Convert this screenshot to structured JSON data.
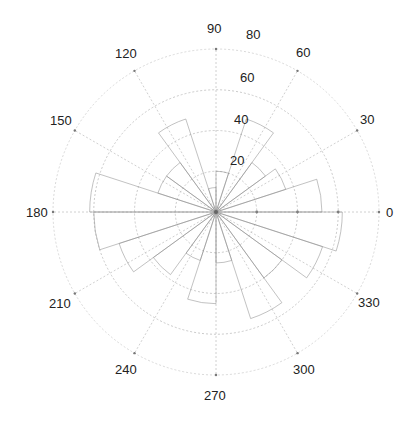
{
  "chart_data": {
    "type": "polar-rose",
    "title": "",
    "angular_ticks_deg": [
      0,
      30,
      60,
      90,
      120,
      150,
      180,
      210,
      240,
      270,
      300,
      330
    ],
    "angular_tick_labels": [
      "0",
      "30",
      "60",
      "90",
      "120",
      "150",
      "180",
      "210",
      "240",
      "270",
      "300",
      "330"
    ],
    "radial_ticks": [
      20,
      40,
      60,
      80
    ],
    "radial_tick_labels": [
      "20",
      "40",
      "60",
      "80"
    ],
    "rlim": [
      0,
      80
    ],
    "radial_label_angle_deg": 80,
    "grid": true,
    "bin_width_deg": 18,
    "bins": [
      {
        "start": 0,
        "end": 18,
        "value": 52
      },
      {
        "start": 18,
        "end": 36,
        "value": 36
      },
      {
        "start": 36,
        "end": 54,
        "value": 30
      },
      {
        "start": 54,
        "end": 72,
        "value": 48
      },
      {
        "start": 72,
        "end": 90,
        "value": 20
      },
      {
        "start": 90,
        "end": 108,
        "value": 12
      },
      {
        "start": 108,
        "end": 126,
        "value": 48
      },
      {
        "start": 126,
        "end": 144,
        "value": 30
      },
      {
        "start": 144,
        "end": 162,
        "value": 30
      },
      {
        "start": 162,
        "end": 180,
        "value": 62
      },
      {
        "start": 180,
        "end": 198,
        "value": 60
      },
      {
        "start": 198,
        "end": 216,
        "value": 50
      },
      {
        "start": 216,
        "end": 234,
        "value": 38
      },
      {
        "start": 234,
        "end": 252,
        "value": 25
      },
      {
        "start": 252,
        "end": 270,
        "value": 45
      },
      {
        "start": 270,
        "end": 288,
        "value": 25
      },
      {
        "start": 288,
        "end": 306,
        "value": 55
      },
      {
        "start": 306,
        "end": 324,
        "value": 40
      },
      {
        "start": 324,
        "end": 342,
        "value": 55
      },
      {
        "start": 342,
        "end": 360,
        "value": 62
      }
    ]
  },
  "labels": {
    "a0": "0",
    "a30": "30",
    "a60": "60",
    "a90": "90",
    "a120": "120",
    "a150": "150",
    "a180": "180",
    "a210": "210",
    "a240": "240",
    "a270": "270",
    "a300": "300",
    "a330": "330",
    "r20": "20",
    "r40": "40",
    "r60": "60",
    "r80": "80"
  }
}
